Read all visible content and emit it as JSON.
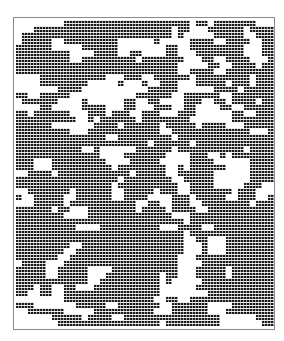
{
  "figure": {
    "type": "binary-occupancy-grid",
    "colors": {
      "filled": "#1a1a1a",
      "empty": "#ffffff",
      "border": "#8a8a8a"
    },
    "cols": 43,
    "rows": 51,
    "grid_rows": [
      "0000000011111111111111111111101101111111000",
      "0001111111111111111111111101100011111101111",
      "0111111111111111111111111101000001111100111",
      "0111110011111111100000010000011110011110011",
      "1111110000011111100000000110011111111100011",
      "1111111110000111100110000110001111111100011",
      "1111111110011111111101111111000110011110001",
      "1111111111111111111111111110000011001111011",
      "1111111111111111111111111110011110011111111",
      "0000111111111110001110011111101111111110111",
      "0000111111110000010001001110001111101110111",
      "0000000111100000000000111110000001111011111",
      "1100111110000000000011111100111111001111111",
      "0111111000010000001100110000111001101111011",
      "0000110000011110001100011100110000110011111",
      "1101111110001110111001110001110000001100111",
      "1111111111001011111101111111100000001111111",
      "1111110000000111101111110111110111100011111",
      "1111111110001111111111110011111111111110001",
      "1111111111111110011111111101111111111111111",
      "1111111111111111111111011111101111111111111",
      "1111111111100100000011111101111111111101111",
      "1111111111111100001111111000011100101111111",
      "1110001111111110000111110000011110000001111",
      "1110001111111111011111111001011111100001111",
      "0011110111111111111011111001111110000001111",
      "1111111111111111101111111100111110000001111",
      "1111111111111111011111111110011110000011100",
      "0011111110111111001111101110011111110111000",
      "1001111100111111001111000011101111100111001",
      "0001111101111111111100110011100111111110111",
      "1111110110001111111101111011110011111111111",
      "1111111100001111111111111100011111111111111",
      "1111111111111111111111111111011111111111111",
      "1111111111000011111111110001111001111111111",
      "1111111111111111111111111111011111111111111",
      "1111111111111111111111111111001100011111111",
      "1111111110011111111111111111000100011111111",
      "1111111100111111111111111111000100011111111",
      "1111111001111111111111111110001111111111111",
      "0111100011111111111111111110000111111111111",
      "1111100111110000111111111110001111101111111",
      "1111100111110001111111110110001111101111111",
      "1111111111110011111111110100000111111111111",
      "1110110011000111111111110000001111111111111",
      "1100110011111111111111110000000011111111111",
      "0000000011111111111111100110011111111111111",
      "1110000000111110011111110011111100001111111",
      "0011111100000111111111100011111100011111111",
      "0000001111101111001111111111111111000000111",
      "0000000111111111111111110111111111000000011"
    ]
  }
}
